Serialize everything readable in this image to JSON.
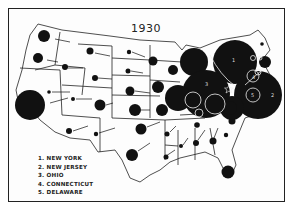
{
  "map": {
    "title": "1930",
    "legend": [
      {
        "num": "1.",
        "label": "NEW YORK"
      },
      {
        "num": "2.",
        "label": "NEW JERSEY"
      },
      {
        "num": "3.",
        "label": "OHIO"
      },
      {
        "num": "4.",
        "label": "CONNECTICUT"
      },
      {
        "num": "5.",
        "label": "DELAWARE"
      }
    ],
    "colors": {
      "ink": "#111111",
      "paper": "#fdfdfd",
      "border": "#222222"
    },
    "circle_labels": [
      "1",
      "2",
      "3",
      "4",
      "5"
    ]
  }
}
